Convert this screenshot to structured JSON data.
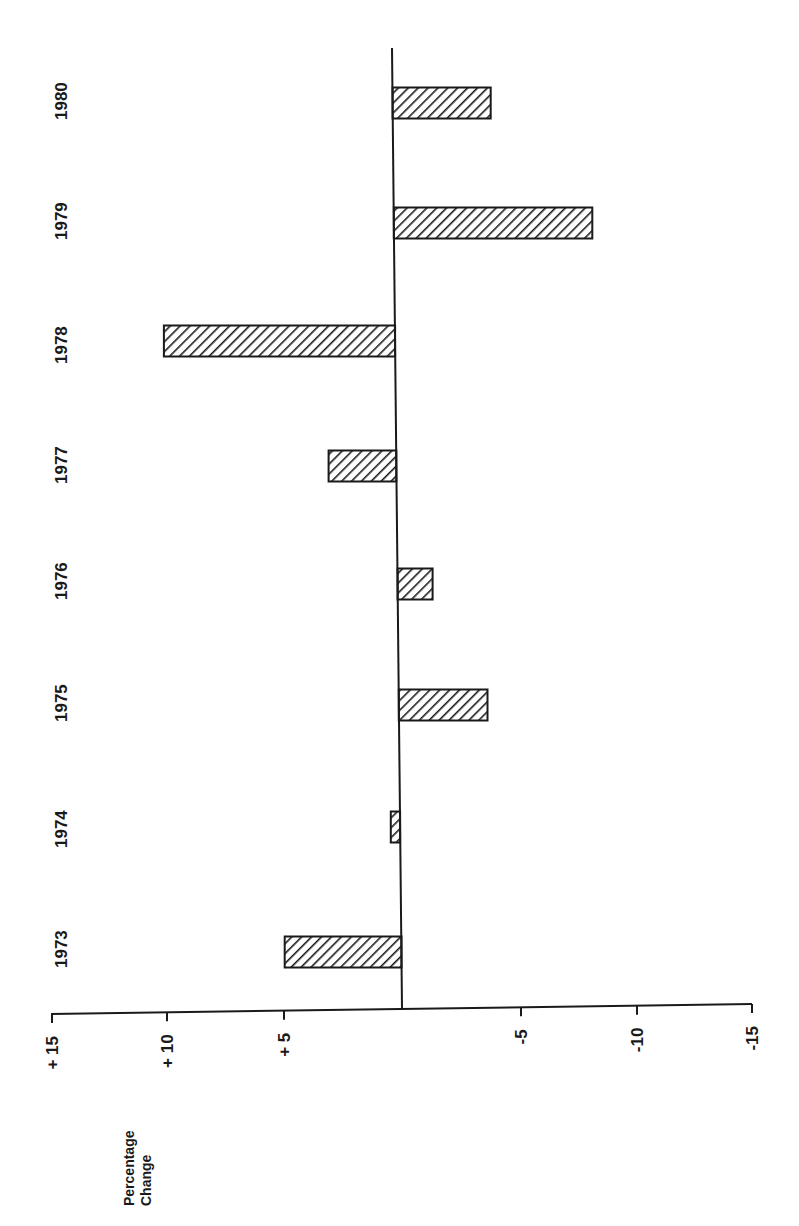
{
  "chart_data": {
    "type": "bar",
    "orientation": "horizontal (page rotated 90°)",
    "title": "",
    "xlabel": "Percentage Change",
    "ylabel": "",
    "categories": [
      "1973",
      "1974",
      "1975",
      "1976",
      "1977",
      "1978",
      "1979",
      "1980"
    ],
    "values": [
      5.0,
      0.4,
      -3.8,
      -1.5,
      2.9,
      9.9,
      -8.5,
      -4.2
    ],
    "value_axis": {
      "range": [
        15,
        -15
      ],
      "ticks": [
        15,
        10,
        5,
        0,
        -5,
        -10,
        -15
      ],
      "tick_labels": [
        "+ 15",
        "+ 10",
        "+ 5",
        "",
        "-5",
        "-10",
        "-15"
      ]
    },
    "grid": false,
    "legend": null,
    "fill_pattern": "diagonal hatch"
  },
  "labels": {
    "axis_title_line1": "Percentage",
    "axis_title_line2": "Change"
  }
}
